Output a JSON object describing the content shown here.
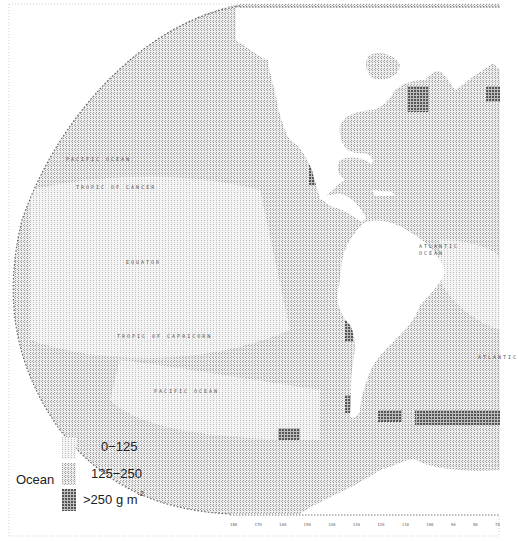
{
  "map": {
    "subject": "Ocean primary productivity",
    "projection": "hemispheric line-printer map",
    "colors": {
      "background": "#ffffff",
      "land": "#ffffff",
      "low": "#e4e4e4",
      "medium": "#cfcfcf",
      "high": "#7a7a7a",
      "border": "#9a9a9a"
    },
    "ocean_labels": [
      {
        "text": "PACIFIC OCEAN",
        "x": 66,
        "y": 159
      },
      {
        "text": "TROPIC OF CANCER",
        "x": 76,
        "y": 187
      },
      {
        "text": "EQUATOR",
        "x": 126,
        "y": 262
      },
      {
        "text": "TROPIC OF CAPRICORN",
        "x": 117,
        "y": 336
      },
      {
        "text": "PACIFIC OCEAN",
        "x": 154,
        "y": 391
      },
      {
        "text": "ATLANTIC",
        "x": 419,
        "y": 246
      },
      {
        "text": "OCEAN",
        "x": 419,
        "y": 253
      },
      {
        "text": "ATLANTIC",
        "x": 478,
        "y": 357
      }
    ],
    "bottom_axis_ticks": [
      "180",
      "170",
      "160",
      "150",
      "140",
      "130",
      "120",
      "110",
      "100",
      "90",
      "80",
      "70"
    ]
  },
  "legend": {
    "title": "Ocean",
    "entries": [
      {
        "label": "0−125",
        "level": "low"
      },
      {
        "label": "125−250",
        "level": "medium"
      },
      {
        "label": ">250 g m",
        "superscript": "-2",
        "level": "high"
      }
    ]
  }
}
